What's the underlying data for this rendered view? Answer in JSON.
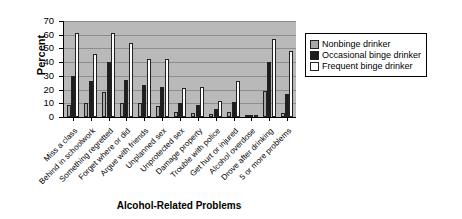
{
  "chart_data": {
    "type": "bar",
    "title": "",
    "xlabel": "Alcohol-Related Problems",
    "ylabel": "Percent",
    "ylim": [
      0,
      70
    ],
    "yticks": [
      0,
      10,
      20,
      30,
      40,
      50,
      60,
      70
    ],
    "grid": true,
    "legend_position": "right",
    "categories": [
      "Miss a class",
      "Behind in schoolwork",
      "Something regretted",
      "Forget where or did",
      "Argue with friends",
      "Unplanned sex",
      "Unprotected sex",
      "Damage property",
      "Trouble with police",
      "Get hurt or injured",
      "Alcohol overdose",
      "Drove after drinking",
      "5 or more problems"
    ],
    "series": [
      {
        "name": "Nonbinge drinker",
        "color": "#a8a8a8",
        "values": [
          9,
          10,
          18,
          10,
          10,
          8,
          4,
          3,
          2,
          4,
          1,
          19,
          3
        ]
      },
      {
        "name": "Occasional binge drinker",
        "color": "#1d1d1d",
        "values": [
          30,
          26,
          40,
          27,
          23,
          22,
          10,
          9,
          6,
          11,
          1,
          40,
          17
        ]
      },
      {
        "name": "Frequent binge drinker",
        "color": "#ffffff",
        "values": [
          61,
          46,
          61,
          54,
          42,
          42,
          21,
          22,
          12,
          26,
          1,
          57,
          48
        ]
      }
    ]
  }
}
